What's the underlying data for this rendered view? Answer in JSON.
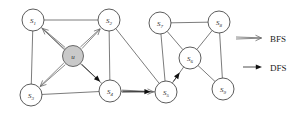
{
  "figure": {
    "background_color": "#ffffff",
    "width": 307,
    "height": 116
  },
  "legend": {
    "items": [
      {
        "label": "BFS",
        "arrow_style": "open-double-head",
        "color": "#6a6a6a"
      },
      {
        "label": "DFS",
        "arrow_style": "solid-filled-head",
        "color": "#111111"
      }
    ]
  },
  "graph": {
    "source_node": "u",
    "nodes": [
      {
        "id": "u",
        "label": "u",
        "sub": "",
        "x": 73,
        "y": 56,
        "r": 10.5,
        "shaded": true
      },
      {
        "id": "S1",
        "label": "S",
        "sub": "1",
        "x": 33,
        "y": 20,
        "r": 11,
        "shaded": false
      },
      {
        "id": "S2",
        "label": "S",
        "sub": "2",
        "x": 109,
        "y": 20,
        "r": 11,
        "shaded": false
      },
      {
        "id": "S3",
        "label": "S",
        "sub": "3",
        "x": 31,
        "y": 95,
        "r": 11,
        "shaded": false
      },
      {
        "id": "S4",
        "label": "S",
        "sub": "4",
        "x": 110,
        "y": 91,
        "r": 11,
        "shaded": false
      },
      {
        "id": "S5",
        "label": "S",
        "sub": "5",
        "x": 166,
        "y": 92,
        "r": 11,
        "shaded": false
      },
      {
        "id": "S6",
        "label": "S",
        "sub": "6",
        "x": 190,
        "y": 58,
        "r": 11,
        "shaded": false
      },
      {
        "id": "S7",
        "label": "S",
        "sub": "7",
        "x": 160,
        "y": 23,
        "r": 11,
        "shaded": false
      },
      {
        "id": "S8",
        "label": "S",
        "sub": "8",
        "x": 219,
        "y": 22,
        "r": 11,
        "shaded": false
      },
      {
        "id": "S9",
        "label": "S",
        "sub": "9",
        "x": 223,
        "y": 89,
        "r": 11,
        "shaded": false
      }
    ],
    "edges": [
      {
        "from": "S1",
        "to": "S2"
      },
      {
        "from": "S1",
        "to": "S3"
      },
      {
        "from": "S1",
        "to": "S4"
      },
      {
        "from": "S2",
        "to": "S4"
      },
      {
        "from": "S2",
        "to": "S5"
      },
      {
        "from": "S3",
        "to": "S4"
      },
      {
        "from": "S4",
        "to": "S5"
      },
      {
        "from": "S5",
        "to": "S6"
      },
      {
        "from": "S5",
        "to": "S7"
      },
      {
        "from": "S6",
        "to": "S7"
      },
      {
        "from": "S6",
        "to": "S8"
      },
      {
        "from": "S6",
        "to": "S9"
      },
      {
        "from": "S7",
        "to": "S8"
      },
      {
        "from": "S8",
        "to": "S9"
      }
    ],
    "bfs_arrows": [
      {
        "from": "u",
        "to": "S1"
      },
      {
        "from": "u",
        "to": "S2"
      },
      {
        "from": "u",
        "to": "S3"
      },
      {
        "from": "S4",
        "to": "S5"
      }
    ],
    "dfs_arrows": [
      {
        "from": "u",
        "to": "S4"
      },
      {
        "from": "S4",
        "to": "S5"
      },
      {
        "from": "S5",
        "to": "S6"
      }
    ]
  }
}
